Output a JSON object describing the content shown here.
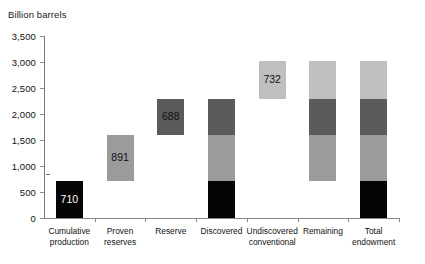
{
  "chart_data": {
    "type": "bar",
    "title": "",
    "ylabel": "Billion barrels",
    "xlabel": "",
    "ylim": [
      0,
      3500
    ],
    "ytick_values": [
      0,
      500,
      1000,
      1500,
      2000,
      2500,
      3000,
      3500
    ],
    "ytick_labels": [
      "0",
      "500",
      "1,000",
      "1,500",
      "2,000",
      "2,500",
      "3,000",
      "3,500"
    ],
    "grid": false,
    "legend": "none",
    "stacked_floating": true,
    "categories": [
      "Cumulative production",
      "Proven reserves",
      "Reserve",
      "Discovered",
      "Undiscovered conventional",
      "Remaining",
      "Total endowment"
    ],
    "category_labels": [
      [
        "Cumulative",
        "production"
      ],
      [
        "Proven",
        "reserves"
      ],
      [
        "Reserve"
      ],
      [
        "Discovered"
      ],
      [
        "Undiscovered",
        "conventional"
      ],
      [
        "Remaining"
      ],
      [
        "Total",
        "endowment"
      ]
    ],
    "components": {
      "cumulative_production": 710,
      "proven_reserves": 891,
      "reserve_growth": 688,
      "undiscovered_conventional": 732
    },
    "bars": [
      {
        "category": "Cumulative production",
        "base": 0,
        "top": 710,
        "segments": [
          {
            "name": "cumulative-production",
            "from": 0,
            "to": 710,
            "value": 710,
            "color": "#050505",
            "tone": "black",
            "label": "710"
          }
        ]
      },
      {
        "category": "Proven reserves",
        "base": 710,
        "top": 1601,
        "segments": [
          {
            "name": "proven-reserves",
            "from": 710,
            "to": 1601,
            "value": 891,
            "color": "#9b9b9b",
            "tone": "mid",
            "label": "891"
          }
        ]
      },
      {
        "category": "Reserve",
        "base": 1601,
        "top": 2289,
        "segments": [
          {
            "name": "reserve-growth",
            "from": 1601,
            "to": 2289,
            "value": 688,
            "color": "#5b5b5b",
            "tone": "dark",
            "label": "688"
          }
        ]
      },
      {
        "category": "Discovered",
        "base": 0,
        "top": 2289,
        "segments": [
          {
            "name": "cumulative-production",
            "from": 0,
            "to": 710,
            "value": 710,
            "color": "#050505",
            "tone": "black",
            "label": ""
          },
          {
            "name": "proven-reserves",
            "from": 710,
            "to": 1601,
            "value": 891,
            "color": "#9b9b9b",
            "tone": "mid",
            "label": ""
          },
          {
            "name": "reserve-growth",
            "from": 1601,
            "to": 2289,
            "value": 688,
            "color": "#5b5b5b",
            "tone": "dark",
            "label": ""
          }
        ]
      },
      {
        "category": "Undiscovered conventional",
        "base": 2289,
        "top": 3021,
        "segments": [
          {
            "name": "undiscovered-conventional",
            "from": 2289,
            "to": 3021,
            "value": 732,
            "color": "#bfbfbf",
            "tone": "light",
            "label": "732"
          }
        ]
      },
      {
        "category": "Remaining",
        "base": 710,
        "top": 3021,
        "segments": [
          {
            "name": "proven-reserves",
            "from": 710,
            "to": 1601,
            "value": 891,
            "color": "#9b9b9b",
            "tone": "mid",
            "label": ""
          },
          {
            "name": "reserve-growth",
            "from": 1601,
            "to": 2289,
            "value": 688,
            "color": "#5b5b5b",
            "tone": "dark",
            "label": ""
          },
          {
            "name": "undiscovered-conventional",
            "from": 2289,
            "to": 3021,
            "value": 732,
            "color": "#bfbfbf",
            "tone": "light",
            "label": ""
          }
        ]
      },
      {
        "category": "Total endowment",
        "base": 0,
        "top": 3021,
        "segments": [
          {
            "name": "cumulative-production",
            "from": 0,
            "to": 710,
            "value": 710,
            "color": "#050505",
            "tone": "black",
            "label": ""
          },
          {
            "name": "proven-reserves",
            "from": 710,
            "to": 1601,
            "value": 891,
            "color": "#9b9b9b",
            "tone": "mid",
            "label": ""
          },
          {
            "name": "reserve-growth",
            "from": 1601,
            "to": 2289,
            "value": 688,
            "color": "#5b5b5b",
            "tone": "dark",
            "label": ""
          },
          {
            "name": "undiscovered-conventional",
            "from": 2289,
            "to": 3021,
            "value": 732,
            "color": "#bfbfbf",
            "tone": "light",
            "label": ""
          }
        ]
      }
    ],
    "colors": {
      "cumulative_production": "#050505",
      "proven_reserves": "#9b9b9b",
      "reserve_growth": "#5b5b5b",
      "undiscovered_conventional": "#bfbfbf",
      "axis": "#8a8a8a",
      "text": "#121212",
      "background": "#ffffff"
    }
  }
}
